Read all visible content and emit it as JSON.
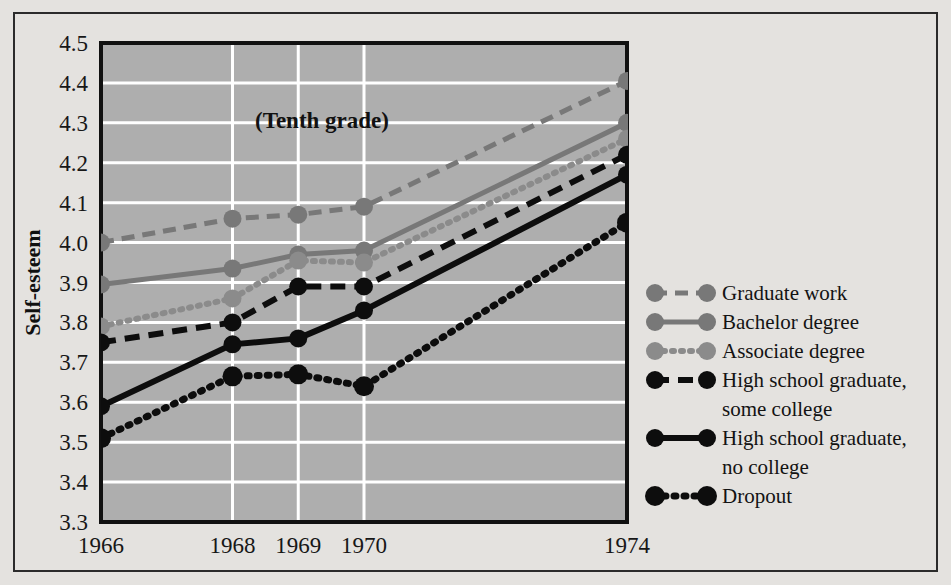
{
  "chart_data": {
    "type": "line",
    "title": "",
    "annotation": "(Tenth grade)",
    "xlabel": "",
    "ylabel": "Self-esteem",
    "x": [
      1966,
      1968,
      1969,
      1970,
      1974
    ],
    "categories": [
      "1966",
      "1968",
      "1969",
      "1970",
      "1974"
    ],
    "xtick_labels": [
      "1966",
      "1968",
      "1969",
      "1970",
      "1974"
    ],
    "ytick_labels": [
      "4.5",
      "4.4",
      "4.3",
      "4.2",
      "4.1",
      "4.0",
      "3.9",
      "3.8",
      "3.7",
      "3.6",
      "3.5",
      "3.4",
      "3.3"
    ],
    "ylim": [
      3.3,
      4.5
    ],
    "xlim": [
      1966,
      1974
    ],
    "ytick_step": 0.1,
    "grid": true,
    "grid_color": "#ffffff",
    "plot_background": "#aeaeae",
    "legend_position": "right",
    "series": [
      {
        "name": "Graduate work",
        "color": "#787878",
        "style": "dashed",
        "dash": "13,8",
        "width": 5,
        "marker": "circle",
        "marker_size": 9,
        "values": [
          4.0,
          4.06,
          4.07,
          4.09,
          4.405
        ]
      },
      {
        "name": "Bachelor degree",
        "color": "#787878",
        "style": "solid",
        "dash": "",
        "width": 5,
        "marker": "circle",
        "marker_size": 9,
        "values": [
          3.895,
          3.935,
          3.97,
          3.98,
          4.3
        ]
      },
      {
        "name": "Associate degree",
        "color": "#8b8b8b",
        "style": "dotted",
        "dash": "2,7",
        "width": 6,
        "marker": "circle",
        "marker_size": 9,
        "values": [
          3.79,
          3.86,
          3.955,
          3.95,
          4.26
        ]
      },
      {
        "name": "High school graduate, some college",
        "color": "#0d0d0d",
        "style": "dashed",
        "dash": "15,9",
        "width": 6,
        "marker": "circle",
        "marker_size": 9,
        "values": [
          3.75,
          3.8,
          3.89,
          3.89,
          4.22
        ]
      },
      {
        "name": "High school graduate, no college",
        "color": "#0d0d0d",
        "style": "solid",
        "dash": "",
        "width": 6,
        "marker": "circle",
        "marker_size": 9,
        "values": [
          3.59,
          3.745,
          3.76,
          3.83,
          4.17
        ]
      },
      {
        "name": "Dropout",
        "color": "#0d0d0d",
        "style": "dotted",
        "dash": "2,8",
        "width": 7,
        "marker": "circle",
        "marker_size": 10,
        "values": [
          3.51,
          3.665,
          3.67,
          3.64,
          4.05
        ]
      }
    ]
  },
  "legend": {
    "entries": [
      {
        "label": "Graduate work",
        "lines": [
          "Graduate work"
        ]
      },
      {
        "label": "Bachelor degree",
        "lines": [
          "Bachelor degree"
        ]
      },
      {
        "label": "Associate degree",
        "lines": [
          "Associate degree"
        ]
      },
      {
        "label": "High school graduate, some college",
        "lines": [
          "High school graduate,",
          "some college"
        ]
      },
      {
        "label": "High school graduate, no college",
        "lines": [
          "High school graduate,",
          "no college"
        ]
      },
      {
        "label": "Dropout",
        "lines": [
          "Dropout"
        ]
      }
    ]
  },
  "colors": {
    "gray_series": "#787878",
    "black_series": "#0d0d0d",
    "plot_bg": "#aeaeae",
    "figure_bg": "#e4e2df",
    "grid": "#ffffff",
    "frame": "#2b2b2b"
  }
}
